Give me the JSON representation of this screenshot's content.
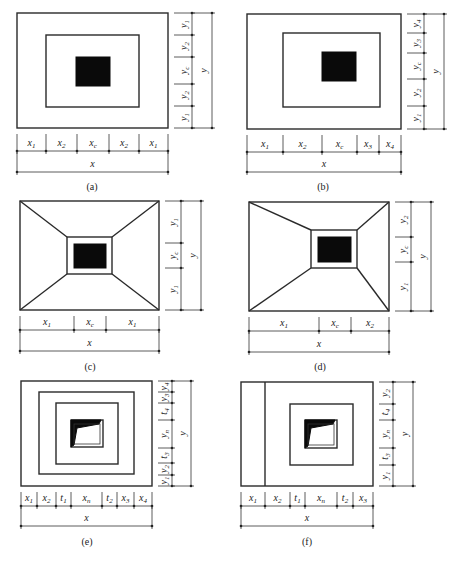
{
  "figure": {
    "panels": [
      {
        "id": "a",
        "caption": "(a)",
        "type": "concentric-rectangles",
        "x_segments": [
          "x1",
          "x2",
          "xc",
          "x2",
          "x1"
        ],
        "y_segments_top_to_bottom": [
          "y1",
          "y2",
          "yc",
          "y2",
          "y1"
        ],
        "x_total": "x",
        "y_total": "y"
      },
      {
        "id": "b",
        "caption": "(b)",
        "type": "concentric-rectangles-offset",
        "x_segments": [
          "x1",
          "x2",
          "xc",
          "x3",
          "x4"
        ],
        "y_segments_top_to_bottom": [
          "y4",
          "y3",
          "yc",
          "y2",
          "y1"
        ],
        "x_total": "x",
        "y_total": "y"
      },
      {
        "id": "c",
        "caption": "(c)",
        "type": "pyramid-symmetric",
        "x_segments": [
          "x1",
          "xc",
          "x1"
        ],
        "y_segments_top_to_bottom": [
          "y1",
          "yc",
          "y1"
        ],
        "x_total": "x",
        "y_total": "y"
      },
      {
        "id": "d",
        "caption": "(d)",
        "type": "pyramid-offset",
        "x_segments": [
          "x1",
          "xc",
          "x2"
        ],
        "y_segments_top_to_bottom": [
          "y2",
          "yc",
          "y1"
        ],
        "x_total": "x",
        "y_total": "y"
      },
      {
        "id": "e",
        "caption": "(e)",
        "type": "stepped-with-cup",
        "x_segments": [
          "x1",
          "x2",
          "t1",
          "xn",
          "t2",
          "x3",
          "x4"
        ],
        "y_segments_top_to_bottom": [
          "y4",
          "y3",
          "t4",
          "yn",
          "t3",
          "y2",
          "y1"
        ],
        "x_total": "x",
        "y_total": "y"
      },
      {
        "id": "f",
        "caption": "(f)",
        "type": "stepped-with-cup-offset",
        "x_segments": [
          "x1",
          "x2",
          "t1",
          "xn",
          "t2",
          "x3"
        ],
        "y_segments_top_to_bottom": [
          "y2",
          "t4",
          "yn",
          "t3",
          "y1"
        ],
        "x_total": "x",
        "y_total": "y"
      }
    ]
  }
}
